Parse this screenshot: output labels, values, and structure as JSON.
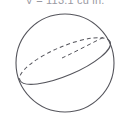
{
  "figure": {
    "kind": "geometry-diagram",
    "width": 130,
    "height": 122,
    "background_color": "#ffffff",
    "stroke_color": "#55555c",
    "caption_color": "#9a9aa2"
  },
  "caption": {
    "text": "V = 113.1 cu in.",
    "clipped": "top"
  },
  "sphere": {
    "label": "sphere-outline",
    "center_x": 65,
    "center_y": 63,
    "radius": 49,
    "stroke_width": 1.1
  },
  "great_circle": {
    "label": "inclined-great-circle",
    "center_x": 65,
    "center_y": 61,
    "semi_major": 49,
    "semi_minor": 14.5,
    "rotation_deg": -23,
    "hidden_arc_style": "dashed",
    "visible_arc_style": "solid",
    "dash_pattern": "4 3",
    "stroke_width": 1.1
  }
}
